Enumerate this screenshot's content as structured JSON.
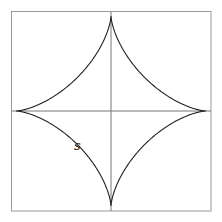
{
  "diagram": {
    "shape": "astroid",
    "box": {
      "x": 11,
      "y": 11,
      "size": 200,
      "stroke": "#888888"
    },
    "axes": {
      "cx": 111,
      "cy": 111,
      "stroke": "#666666"
    },
    "curve": {
      "radius": 95,
      "stroke": "#222222"
    },
    "label": {
      "text": "S",
      "x": 72,
      "y": 138
    }
  }
}
